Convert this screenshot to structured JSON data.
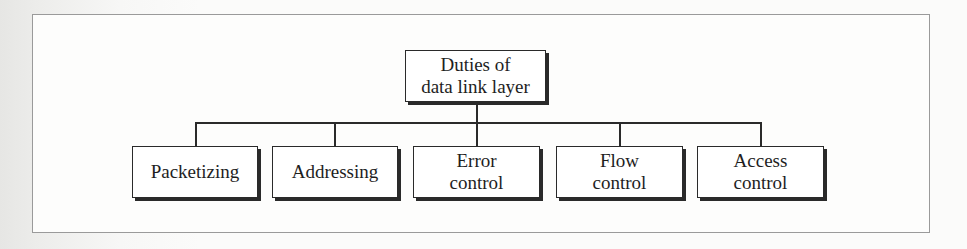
{
  "diagram": {
    "type": "hierarchy-tree",
    "root": {
      "lines": [
        "Duties of",
        "data link layer"
      ]
    },
    "children": [
      {
        "lines": [
          "Packetizing"
        ]
      },
      {
        "lines": [
          "Addressing"
        ]
      },
      {
        "lines": [
          "Error",
          "control"
        ]
      },
      {
        "lines": [
          "Flow",
          "control"
        ]
      },
      {
        "lines": [
          "Access",
          "control"
        ]
      }
    ]
  }
}
